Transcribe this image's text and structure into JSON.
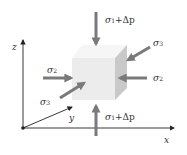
{
  "figure": {
    "colors": {
      "arrow": "#7a7a7a",
      "axis": "#222222",
      "cube_front": "#ececec",
      "cube_top": "#f6f6f6",
      "cube_side": "#c9c9c9",
      "text": "#333333"
    },
    "axes": {
      "x_label": "x",
      "y_label": "y",
      "z_label": "z"
    },
    "loads": {
      "top": {
        "symbol": "σ",
        "sub": "1",
        "suffix": "+Δp"
      },
      "bottom": {
        "symbol": "σ",
        "sub": "1",
        "suffix": "+Δp"
      },
      "left": {
        "symbol": "σ",
        "sub": "2"
      },
      "right": {
        "symbol": "σ",
        "sub": "2"
      },
      "front": {
        "symbol": "σ",
        "sub": "3"
      },
      "back": {
        "symbol": "σ",
        "sub": "3"
      }
    }
  }
}
